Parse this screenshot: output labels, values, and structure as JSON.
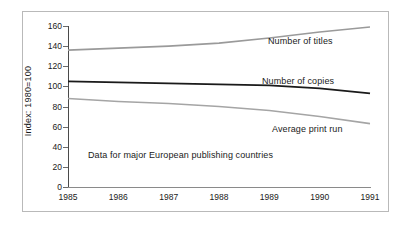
{
  "chart_data": {
    "type": "line",
    "title": "",
    "xlabel": "",
    "ylabel": "Index: 1980=100",
    "x": [
      1985,
      1986,
      1987,
      1988,
      1989,
      1990,
      1991
    ],
    "xticklabels": [
      "1985",
      "1986",
      "1987",
      "1988",
      "1989",
      "1990",
      "1991"
    ],
    "yticks": [
      0,
      20,
      40,
      60,
      80,
      100,
      120,
      140,
      160
    ],
    "yticklabels": [
      "0",
      "20",
      "40",
      "60",
      "80",
      "100",
      "120",
      "140",
      "160"
    ],
    "ylim": [
      0,
      160
    ],
    "xlim": [
      1985,
      1991
    ],
    "grid": false,
    "legend_position": "inline-right",
    "annotation": "Data for major European publishing countries",
    "series": [
      {
        "name": "Number of titles",
        "values": [
          136,
          138,
          140,
          143,
          148,
          154,
          159
        ],
        "color": "#9a9a9a",
        "label_text": "Number of titles"
      },
      {
        "name": "Number of copies",
        "values": [
          105,
          104,
          103,
          102,
          101,
          98,
          93
        ],
        "color": "#1a1a1a",
        "label_text": "Number of copies"
      },
      {
        "name": "Average print run",
        "values": [
          88,
          85,
          83,
          80,
          76,
          70,
          63
        ],
        "color": "#a5a5a5",
        "label_text": "Average print run"
      }
    ]
  },
  "labels": {
    "y_axis_title": "Index: 1980=100",
    "annotation": "Data for major European publishing countries",
    "series_titles": "Number of titles",
    "series_copies": "Number of copies",
    "series_printrun": "Average print run"
  }
}
